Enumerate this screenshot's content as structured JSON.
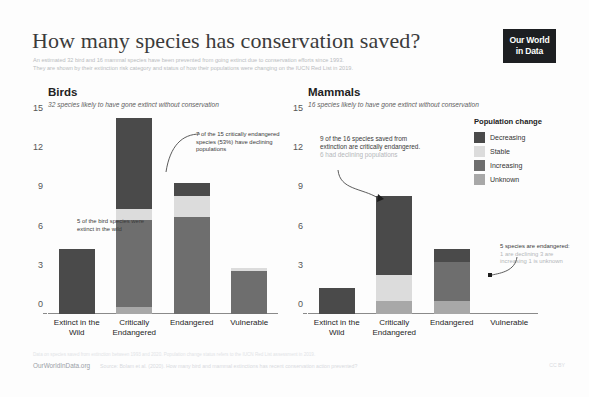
{
  "header": {
    "title": "How many species has conservation saved?",
    "subtitle_line1": "An estimated 32 bird and 16 mammal species have been prevented from going extinct due to conservation efforts since 1993.",
    "subtitle_line2": "They are shown by their extinction risk category and status of how their populations were changing on the IUCN Red List in 2019.",
    "logo_line1": "Our World",
    "logo_line2": "in Data"
  },
  "legend": {
    "title": "Population change",
    "items": [
      {
        "label": "Decreasing",
        "color": "#4a4a4a"
      },
      {
        "label": "Stable",
        "color": "#dcdcdc"
      },
      {
        "label": "Increasing",
        "color": "#6e6e6e"
      },
      {
        "label": "Unknown",
        "color": "#a8a8a8"
      }
    ]
  },
  "panels": [
    {
      "id": "birds",
      "title": "Birds",
      "subtitle": "32 species likely to have gone extinct without conservation"
    },
    {
      "id": "mammals",
      "title": "Mammals",
      "subtitle": "16 species likely to have gone extinct without conservation"
    }
  ],
  "annotations": {
    "birds_extinct_wild": "5 of the bird species were extinct in the wild",
    "birds_critical": "7 of the 15 critically endangered species (53%) have declining populations",
    "mammals_critical_main": "9 of the 16 species saved from extinction are critically endangered.",
    "mammals_critical_muted": "6 had declining populations",
    "mammals_endangered_main": "5 species are endangered:",
    "mammals_endangered_muted": "1 are declining 3 are increasing 1 is unknown"
  },
  "footer": {
    "owid": "OurWorldInData.org",
    "source": "Source: Bolam et al. (2020). How many bird and mammal extinctions has recent conservation action prevented?",
    "note": "Data on species saved from extinction between 1993 and 2020. Population change status refers to the IUCN Red List assessment in 2019.",
    "licence": "CC BY"
  },
  "chart_data": {
    "type": "bar",
    "title": "How many species has conservation saved?",
    "stacked": true,
    "ylabel": "",
    "xlabel": "",
    "ylim": [
      0,
      15
    ],
    "yticks": [
      0,
      3,
      6,
      9,
      12,
      15
    ],
    "grid": false,
    "legend_position": "right",
    "legend_title": "Population change",
    "series": [
      {
        "name": "Decreasing",
        "color": "#4a4a4a"
      },
      {
        "name": "Stable",
        "color": "#dcdcdc"
      },
      {
        "name": "Increasing",
        "color": "#6e6e6e"
      },
      {
        "name": "Unknown",
        "color": "#a8a8a8"
      }
    ],
    "panels": [
      {
        "name": "Birds",
        "categories": [
          "Extinct in the Wild",
          "Critically Endangered",
          "Endangered",
          "Vulnerable"
        ],
        "stacks": [
          {
            "category": "Extinct in the Wild",
            "Decreasing": 5,
            "Stable": 0,
            "Increasing": 0,
            "Unknown": 0
          },
          {
            "category": "Critically Endangered",
            "Decreasing": 7,
            "Stable": 0.8,
            "Increasing": 6.7,
            "Unknown": 0.5
          },
          {
            "category": "Endangered",
            "Decreasing": 1,
            "Stable": 1.6,
            "Increasing": 7.4,
            "Unknown": 0
          },
          {
            "category": "Vulnerable",
            "Decreasing": 0,
            "Stable": 0.2,
            "Increasing": 3.3,
            "Unknown": 0
          }
        ],
        "totals": [
          5,
          15,
          10,
          3.5
        ]
      },
      {
        "name": "Mammals",
        "categories": [
          "Extinct in the Wild",
          "Critically Endangered",
          "Endangered",
          "Vulnerable"
        ],
        "stacks": [
          {
            "category": "Extinct in the Wild",
            "Decreasing": 2,
            "Stable": 0,
            "Increasing": 0,
            "Unknown": 0
          },
          {
            "category": "Critically Endangered",
            "Decreasing": 6,
            "Stable": 2,
            "Increasing": 0,
            "Unknown": 1
          },
          {
            "category": "Endangered",
            "Decreasing": 1,
            "Stable": 0,
            "Increasing": 3,
            "Unknown": 1
          },
          {
            "category": "Vulnerable",
            "Decreasing": 0,
            "Stable": 0,
            "Increasing": 0,
            "Unknown": 0
          }
        ],
        "totals": [
          2,
          9,
          5,
          0
        ]
      }
    ]
  }
}
